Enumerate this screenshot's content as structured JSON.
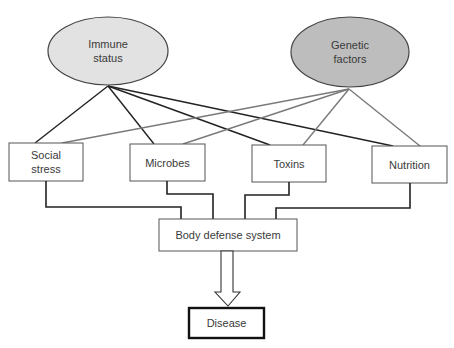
{
  "diagram": {
    "type": "influence-flow",
    "colors": {
      "background": "#ffffff",
      "immune_fill": "#e2e2e2",
      "genetic_fill": "#bdbdbd",
      "immune_line": "#222222",
      "genetic_line": "#7a7a7a",
      "box_border": "#555555",
      "text": "#3a3a3a"
    },
    "sources": [
      {
        "id": "immune",
        "label": "Immune\nstatus",
        "shape": "ellipse",
        "cx": 108,
        "cy": 51,
        "rx": 60,
        "ry": 34
      },
      {
        "id": "genetic",
        "label": "Genetic\nfactors",
        "shape": "ellipse",
        "cx": 350,
        "cy": 52,
        "rx": 59,
        "ry": 35
      }
    ],
    "factors": [
      {
        "id": "social-stress",
        "label": "Social\nstress",
        "x": 9,
        "y": 143,
        "w": 74,
        "h": 38
      },
      {
        "id": "microbes",
        "label": "Microbes",
        "x": 130,
        "y": 144,
        "w": 75,
        "h": 37
      },
      {
        "id": "toxins",
        "label": "Toxins",
        "x": 252,
        "y": 145,
        "w": 74,
        "h": 37
      },
      {
        "id": "nutrition",
        "label": "Nutrition",
        "x": 372,
        "y": 146,
        "w": 75,
        "h": 37
      }
    ],
    "edges_immune": [
      {
        "to": "social-stress",
        "x1": 108,
        "y1": 86,
        "x2": 35,
        "y2": 143
      },
      {
        "to": "microbes",
        "x1": 108,
        "y1": 86,
        "x2": 154,
        "y2": 144
      },
      {
        "to": "toxins",
        "x1": 108,
        "y1": 86,
        "x2": 270,
        "y2": 145
      },
      {
        "to": "nutrition",
        "x1": 108,
        "y1": 86,
        "x2": 393,
        "y2": 146
      }
    ],
    "edges_genetic": [
      {
        "to": "social-stress",
        "x1": 349,
        "y1": 89,
        "x2": 62,
        "y2": 143
      },
      {
        "to": "microbes",
        "x1": 349,
        "y1": 89,
        "x2": 183,
        "y2": 144
      },
      {
        "to": "toxins",
        "x1": 349,
        "y1": 89,
        "x2": 303,
        "y2": 145
      },
      {
        "to": "nutrition",
        "x1": 349,
        "y1": 89,
        "x2": 420,
        "y2": 146
      }
    ],
    "connectors": [
      {
        "from": "social-stress",
        "points": "46,181 46,207 181,207 181,219"
      },
      {
        "from": "microbes",
        "points": "167,181 167,194 213,194 213,219"
      },
      {
        "from": "toxins",
        "points": "289,182 289,195 245,195 245,219"
      },
      {
        "from": "nutrition",
        "points": "410,183 410,208 276,208 276,219"
      }
    ],
    "body_defense": {
      "label": "Body defense system",
      "x": 159,
      "y": 219,
      "w": 138,
      "h": 32
    },
    "arrow": {
      "points": "221,251 233,251 233,292 240,292 228,306 215,292 221,292"
    },
    "outcome": {
      "label": "Disease",
      "x": 189,
      "y": 308,
      "w": 75,
      "h": 30
    }
  }
}
